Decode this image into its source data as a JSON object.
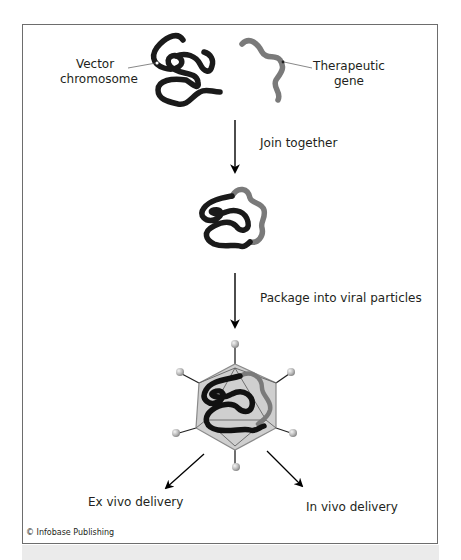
{
  "figure": {
    "labels": {
      "vector_chromosome": [
        "Vector",
        "chromosome"
      ],
      "therapeutic_gene": [
        "Therapeutic",
        "gene"
      ],
      "step1": "Join together",
      "step2": "Package into viral particles",
      "ex_vivo": "Ex vivo delivery",
      "in_vivo": "In vivo delivery"
    },
    "credit": "© Infobase Publishing",
    "colors": {
      "dna_vector": "#1a1a1a",
      "dna_gene": "#7a7a7a",
      "capsid_fill": "#cfcfcf",
      "capsid_stroke": "#8a8a8a",
      "frame_border": "#6d6d6d",
      "band": "#ebebeb"
    }
  }
}
